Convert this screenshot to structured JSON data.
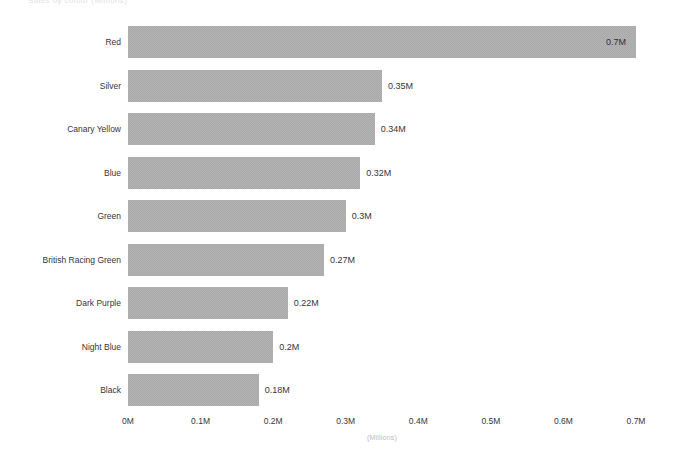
{
  "top_title": "Sales by colour (Millions)",
  "chart_data": {
    "type": "bar",
    "orientation": "horizontal",
    "title": "",
    "xlabel": "(Millions)",
    "ylabel": "",
    "xlim": [
      0,
      0.7
    ],
    "grid": false,
    "legend": "none",
    "bar_color": "#a9a9a9",
    "text_color": "#35353a",
    "axis_title_color": "#b9b9bf",
    "categories": [
      "Red",
      "Silver",
      "Canary Yellow",
      "Blue",
      "Green",
      "British Racing Green",
      "Dark Purple",
      "Night Blue",
      "Black"
    ],
    "values": [
      0.7,
      0.35,
      0.34,
      0.32,
      0.3,
      0.27,
      0.22,
      0.2,
      0.18
    ],
    "value_labels": [
      "0.7M",
      "0.35M",
      "0.34M",
      "0.32M",
      "0.3M",
      "0.27M",
      "0.22M",
      "0.2M",
      "0.18M"
    ],
    "label_placement": [
      "inside",
      "outside",
      "outside",
      "outside",
      "outside",
      "outside",
      "outside",
      "outside",
      "outside"
    ],
    "xticks": [
      0,
      0.1,
      0.2,
      0.3,
      0.4,
      0.5,
      0.6,
      0.7
    ],
    "xtick_labels": [
      "0M",
      "0.1M",
      "0.2M",
      "0.3M",
      "0.4M",
      "0.5M",
      "0.6M",
      "0.7M"
    ]
  }
}
